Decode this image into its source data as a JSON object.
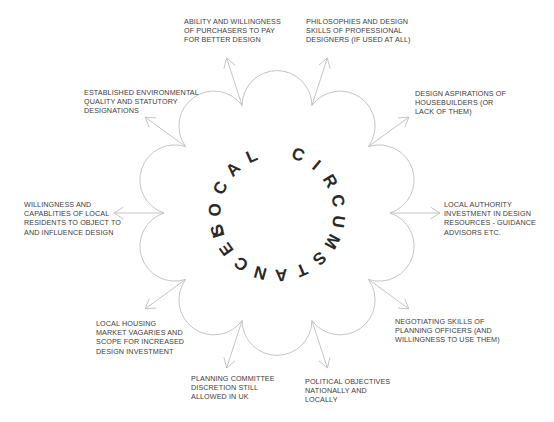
{
  "diagram": {
    "center_title": "LOCAL CIRCUMSTANCES",
    "center_words": [
      "LOCAL",
      "CIRCUMSTANCES"
    ],
    "geometry": {
      "cx": 277,
      "cy": 213,
      "cusp_radius": 113,
      "arrow_length": 50,
      "cusps": 10
    },
    "colors": {
      "line": "#bdbdbd",
      "text": "#3c3c3c",
      "center_text": "#2a2a2a"
    },
    "factors": [
      {
        "id": "purchasers",
        "lines": [
          "ABILITY AND WILLINGNESS",
          "OF PURCHASERS TO PAY",
          "FOR BETTER DESIGN"
        ],
        "x": 184,
        "y": 17
      },
      {
        "id": "designers",
        "lines": [
          "PHILOSOPHIES AND DESIGN",
          "SKILLS OF PROFESSIONAL",
          "DESIGNERS (IF USED AT ALL)"
        ],
        "x": 306,
        "y": 17
      },
      {
        "id": "housebuilders",
        "lines": [
          "DESIGN ASPIRATIONS OF",
          "HOUSEBUILDERS (OR",
          "LACK OF THEM)"
        ],
        "x": 415,
        "y": 89
      },
      {
        "id": "local-authority",
        "lines": [
          "LOCAL AUTHORITY",
          "INVESTMENT IN DESIGN",
          "RESOURCES - GUIDANCE",
          "ADVISORS Etc."
        ],
        "x": 444,
        "y": 200
      },
      {
        "id": "negotiating",
        "lines": [
          "NEGOTIATING SKILLS OF",
          "PLANNING OFFICERS (AND",
          "WILLINGNESS TO USE THEM)"
        ],
        "x": 395,
        "y": 317
      },
      {
        "id": "political",
        "lines": [
          "POLITICAL OBJECTIVES",
          "NATIONALLY AND",
          "LOCALLY"
        ],
        "x": 305,
        "y": 377
      },
      {
        "id": "committee",
        "lines": [
          "PLANNING COMMITTEE",
          "DISCRETION STILL",
          "ALLOWED IN UK"
        ],
        "x": 191,
        "y": 374
      },
      {
        "id": "housing-market",
        "lines": [
          "LOCAL HOUSING",
          "MARKET VAGARIES AND",
          "SCOPE FOR INCREASED",
          "DESIGN INVESTMENT"
        ],
        "x": 96,
        "y": 319
      },
      {
        "id": "residents",
        "lines": [
          "WILLINGNESS AND",
          "CAPABLITIES OF LOCAL",
          "RESIDENTS TO OBJECT TO",
          "AND INFLUENCE DESIGN"
        ],
        "x": 24,
        "y": 200
      },
      {
        "id": "environmental",
        "lines": [
          "ESTABLISHED ENVIRONMENTAL",
          "QUALITY AND STATUTORY",
          "DESIGNATIONS"
        ],
        "x": 84,
        "y": 88
      }
    ]
  }
}
